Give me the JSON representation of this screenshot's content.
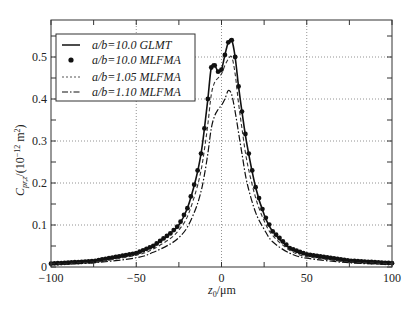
{
  "chart_data": {
    "type": "line",
    "title": "",
    "xlabel": "z0 /μm",
    "ylabel": "C_pr,z /(10^-12 m^2)",
    "xlim": [
      -100,
      100
    ],
    "ylim": [
      0,
      0.57
    ],
    "xticks": [
      -100,
      -50,
      0,
      50,
      100
    ],
    "yticks": [
      0,
      0.1,
      0.2,
      0.3,
      0.4,
      0.5
    ],
    "xtick_labels": [
      "−100",
      "−50",
      "0",
      "50",
      "100"
    ],
    "ytick_labels": [
      "0",
      "0.1",
      "0.2",
      "0.3",
      "0.4",
      "0.5"
    ],
    "grid": true,
    "legend_position": "upper left",
    "series": [
      {
        "name": "a/b=10.0 GLMT",
        "style": "solid",
        "x": [
          -100,
          -75,
          -50,
          -40,
          -30,
          -25,
          -20,
          -15,
          -12,
          -10,
          -8,
          -6,
          -4,
          -2,
          0,
          2,
          4,
          6,
          8,
          10,
          12,
          15,
          20,
          25,
          30,
          40,
          50,
          75,
          100
        ],
        "values": [
          0.008,
          0.014,
          0.033,
          0.05,
          0.08,
          0.1,
          0.14,
          0.21,
          0.27,
          0.33,
          0.4,
          0.475,
          0.48,
          0.465,
          0.47,
          0.505,
          0.535,
          0.54,
          0.5,
          0.43,
          0.37,
          0.29,
          0.19,
          0.125,
          0.085,
          0.045,
          0.03,
          0.015,
          0.009
        ]
      },
      {
        "name": "a/b=10.0 MLFMA",
        "style": "markers",
        "x": [
          -100,
          -75,
          -50,
          -40,
          -30,
          -25,
          -20,
          -15,
          -12,
          -10,
          -8,
          -6,
          -4,
          -2,
          0,
          2,
          4,
          6,
          8,
          10,
          12,
          15,
          20,
          25,
          30,
          40,
          50,
          75,
          100
        ],
        "values": [
          0.008,
          0.014,
          0.033,
          0.05,
          0.08,
          0.1,
          0.14,
          0.21,
          0.27,
          0.33,
          0.4,
          0.475,
          0.48,
          0.465,
          0.47,
          0.505,
          0.535,
          0.54,
          0.5,
          0.43,
          0.37,
          0.29,
          0.19,
          0.125,
          0.085,
          0.045,
          0.03,
          0.015,
          0.009
        ]
      },
      {
        "name": "a/b=1.05 MLFMA",
        "style": "dotted",
        "x": [
          -100,
          -75,
          -50,
          -40,
          -30,
          -25,
          -20,
          -15,
          -12,
          -10,
          -8,
          -6,
          -4,
          -2,
          0,
          2,
          4,
          6,
          8,
          10,
          12,
          15,
          20,
          25,
          30,
          40,
          50,
          75,
          100
        ],
        "values": [
          0.007,
          0.012,
          0.028,
          0.043,
          0.068,
          0.088,
          0.12,
          0.18,
          0.23,
          0.28,
          0.34,
          0.41,
          0.44,
          0.45,
          0.46,
          0.48,
          0.495,
          0.5,
          0.46,
          0.39,
          0.33,
          0.25,
          0.165,
          0.11,
          0.075,
          0.04,
          0.025,
          0.012,
          0.008
        ]
      },
      {
        "name": "a/b=1.10 MLFMA",
        "style": "dash-dot",
        "x": [
          -100,
          -75,
          -50,
          -40,
          -30,
          -25,
          -20,
          -15,
          -12,
          -10,
          -8,
          -6,
          -4,
          -2,
          0,
          2,
          4,
          6,
          8,
          10,
          12,
          15,
          20,
          25,
          30,
          40,
          50,
          75,
          100
        ],
        "values": [
          0.006,
          0.01,
          0.022,
          0.035,
          0.055,
          0.07,
          0.095,
          0.14,
          0.18,
          0.22,
          0.27,
          0.33,
          0.36,
          0.375,
          0.385,
          0.4,
          0.42,
          0.41,
          0.37,
          0.32,
          0.27,
          0.2,
          0.13,
          0.09,
          0.06,
          0.033,
          0.021,
          0.01,
          0.006
        ]
      }
    ]
  },
  "legend": {
    "items": [
      {
        "label": "a/b=10.0 GLMT"
      },
      {
        "label": "a/b=10.0 MLFMA"
      },
      {
        "label": "a/b=1.05 MLFMA"
      },
      {
        "label": "a/b=1.10 MLFMA"
      }
    ]
  },
  "axes": {
    "xlabel_main": "z",
    "xlabel_sub": "0",
    "xlabel_unit": "/μm",
    "ylabel_main": "C",
    "ylabel_sub": "pr,z",
    "ylabel_unit": "/(10",
    "ylabel_exp": "−12",
    "ylabel_tail": " m",
    "ylabel_exp2": "2",
    "ylabel_close": ")"
  }
}
